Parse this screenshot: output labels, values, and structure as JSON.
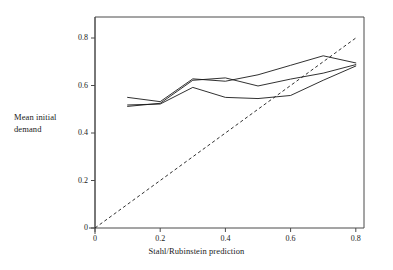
{
  "chart_data": {
    "type": "line",
    "title": "",
    "xlabel": "Stahl/Rubinstein prediction",
    "ylabel": "Mean initial demand",
    "ylabel_lines": [
      "Mean initial",
      "demand"
    ],
    "xlim": [
      0,
      0.85
    ],
    "ylim": [
      0,
      0.88
    ],
    "xticks": [
      0,
      0.2,
      0.4,
      0.6,
      0.8
    ],
    "xtick_labels": [
      "0",
      "0.2",
      "0.4",
      "0.6",
      "0.8"
    ],
    "yticks": [
      0,
      0.2,
      0.4,
      0.6,
      0.8
    ],
    "ytick_labels": [
      "0",
      "0.2",
      "0.4",
      "0.6",
      "0.8"
    ],
    "grid": false,
    "legend": "none",
    "x": [
      0.1,
      0.2,
      0.3,
      0.4,
      0.5,
      0.6,
      0.7,
      0.8
    ],
    "series": [
      {
        "name": "series-1",
        "style": "solid",
        "color": "#1a1a1a",
        "values": [
          0.55,
          0.532,
          0.628,
          0.618,
          0.645,
          0.685,
          0.725,
          0.695
        ]
      },
      {
        "name": "series-2",
        "style": "solid",
        "color": "#1a1a1a",
        "values": [
          0.512,
          0.525,
          0.622,
          0.632,
          0.598,
          0.627,
          0.652,
          0.688
        ]
      },
      {
        "name": "series-3",
        "style": "solid",
        "color": "#1a1a1a",
        "values": [
          0.518,
          0.522,
          0.592,
          0.55,
          0.545,
          0.558,
          0.622,
          0.682
        ]
      }
    ],
    "reference_line": {
      "name": "forty-five-degree-line",
      "style": "dashed",
      "color": "#1a1a1a",
      "x": [
        0,
        0.8
      ],
      "values": [
        0,
        0.8
      ]
    }
  },
  "ticks": {
    "x": [
      {
        "label": "0"
      },
      {
        "label": "0.2"
      },
      {
        "label": "0.4"
      },
      {
        "label": "0.6"
      },
      {
        "label": "0.8"
      }
    ],
    "y": [
      {
        "label": "0"
      },
      {
        "label": "0.2"
      },
      {
        "label": "0.4"
      },
      {
        "label": "0.6"
      },
      {
        "label": "0.8"
      }
    ]
  }
}
